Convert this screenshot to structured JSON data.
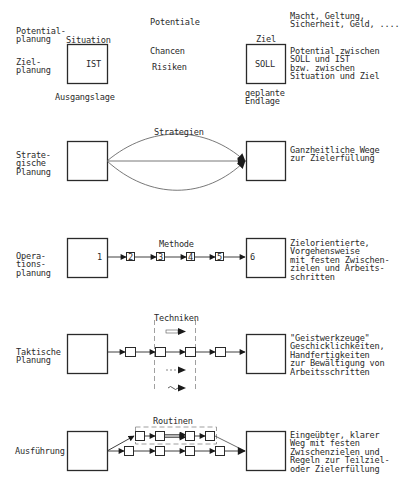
{
  "header_row": {
    "left_labels": [
      "Potential-\nplanung",
      "Ziel-\nplanung"
    ],
    "situation_label": "Situation",
    "ist_box_label": "IST",
    "ausgangslage_label": "Ausgangslage",
    "potentiale_label": "Potentiale",
    "chancen_label": "Chancen",
    "risiken_label": "Risiken",
    "ziel_label": "Ziel",
    "soll_box_label": "SOLL",
    "endlage_label": "geplante\nEndlage",
    "motives_text": "Macht, Geltung,\nSicherheit, Geld, ....",
    "potential_desc": "Potential zwischen\nSOLL und IST\nbzw. zwischen\nSituation und Ziel"
  },
  "rows": [
    {
      "id": "strategisch",
      "left_label": "Strate-\ngische\nPlanung",
      "center_label": "Strategien",
      "right_desc": "Ganzheitliche Wege\nzur Zielerfüllung"
    },
    {
      "id": "operativ",
      "left_label": "Opera-\ntions-\nplanung",
      "center_label": "Methode",
      "start_number": "1",
      "step_numbers": [
        "2",
        "3",
        "4",
        "5"
      ],
      "end_number": "6",
      "right_desc": "Zielorientierte,\nVorgehensweise\nmit festen Zwischen-\nzielen und Arbeits-\nschritten"
    },
    {
      "id": "taktisch",
      "left_label": "Taktische\nPlanung",
      "center_label": "Techniken",
      "right_desc": "\"Geistwerkzeuge\"\nGeschicklichkeiten,\nHandfertigkeiten\nzur Bewältigung von\nArbeitsschritten"
    },
    {
      "id": "ausfuehrung",
      "left_label": "Ausführung",
      "center_label": "Routinen",
      "right_desc": "Eingeübter, klarer\nWeg mit festen\nZwischenzielen und\nRegeln zur Teilziel-\noder Zielerfüllung"
    }
  ],
  "colors": {
    "line": "#2a2a2a",
    "background": "#ffffff",
    "dashed": "#6a6a6a"
  }
}
